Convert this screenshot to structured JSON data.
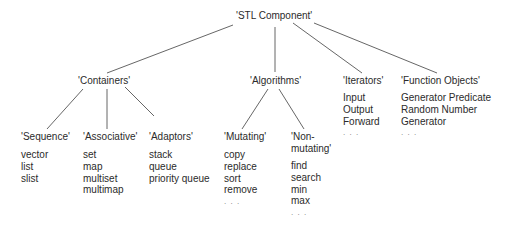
{
  "diagram": {
    "root": {
      "label": "'STL Component'"
    },
    "categories": [
      {
        "label": "'Containers'"
      },
      {
        "label": "'Algorithms'"
      },
      {
        "label": "'Iterators'",
        "items": [
          "Input",
          "Output",
          "Forward",
          ". . ."
        ]
      },
      {
        "label": "'Function Objects'",
        "items": [
          "Generator Predicate",
          "Random Number",
          "Generator",
          ". . ."
        ]
      }
    ],
    "subcategories": {
      "containers": [
        {
          "label": "'Sequence'",
          "items": [
            "vector",
            "list",
            "slist"
          ]
        },
        {
          "label": "'Associative'",
          "items": [
            "set",
            "map",
            "multiset",
            "multimap"
          ]
        },
        {
          "label": "'Adaptors'",
          "items": [
            "stack",
            "queue",
            "priority queue"
          ]
        }
      ],
      "algorithms": [
        {
          "label": "'Mutating'",
          "items": [
            "copy",
            "replace",
            "sort",
            "remove",
            ". . ."
          ]
        },
        {
          "label_line1": "'Non-",
          "label_line2": "mutating'",
          "items": [
            "find",
            "search",
            "min",
            "max",
            ". . ."
          ]
        }
      ]
    },
    "colors": {
      "text": "#2b2b2b",
      "edge": "#555555",
      "background": "#ffffff"
    }
  }
}
